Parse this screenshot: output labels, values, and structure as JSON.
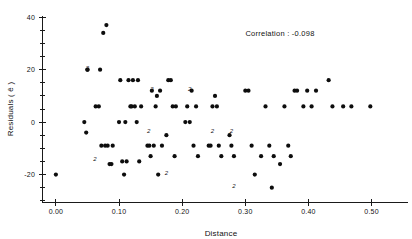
{
  "chart_data": {
    "type": "scatter",
    "title": "",
    "xlabel": "Distance",
    "ylabel": "Residuals ( ê )",
    "xlim": [
      -0.022,
      0.545
    ],
    "ylim": [
      -32,
      42
    ],
    "grid": false,
    "legend_position": "none",
    "annotations": [
      {
        "text": "Correlation : -0.098",
        "x": 0.355,
        "y": 33
      }
    ],
    "xticks": [
      0.0,
      0.1,
      0.2,
      0.3,
      0.4,
      0.5
    ],
    "xtick_labels": [
      "0.00",
      "0.10",
      "0.20",
      "0.30",
      "0.40",
      "0.50"
    ],
    "yticks": [
      -20,
      0,
      20,
      40
    ],
    "ytick_labels": [
      "-20",
      "0",
      "20",
      "40"
    ],
    "yticks_minor": [
      -30,
      -25,
      -15,
      -10,
      -5,
      5,
      10,
      15,
      25,
      30,
      35
    ],
    "point_marker": "filled-circle",
    "point_color": "#0d0d0d",
    "point_radius": 2.1,
    "overlap_marker_note": "Digit 2 denotes two coincident observations at that location",
    "x": [
      0.0,
      0.045,
      0.048,
      0.05,
      0.05,
      0.063,
      0.068,
      0.07,
      0.072,
      0.075,
      0.078,
      0.08,
      0.082,
      0.085,
      0.088,
      0.09,
      0.1,
      0.102,
      0.105,
      0.108,
      0.11,
      0.112,
      0.115,
      0.118,
      0.12,
      0.122,
      0.125,
      0.128,
      0.13,
      0.132,
      0.135,
      0.145,
      0.148,
      0.15,
      0.152,
      0.155,
      0.158,
      0.16,
      0.162,
      0.165,
      0.168,
      0.175,
      0.178,
      0.182,
      0.185,
      0.188,
      0.19,
      0.205,
      0.208,
      0.212,
      0.215,
      0.218,
      0.222,
      0.225,
      0.242,
      0.245,
      0.248,
      0.252,
      0.255,
      0.258,
      0.262,
      0.275,
      0.278,
      0.282,
      0.3,
      0.305,
      0.31,
      0.315,
      0.325,
      0.332,
      0.338,
      0.342,
      0.345,
      0.355,
      0.362,
      0.368,
      0.372,
      0.378,
      0.382,
      0.392,
      0.398,
      0.405,
      0.412,
      0.432,
      0.438,
      0.455,
      0.468,
      0.498
    ],
    "y": [
      -20,
      0,
      -4,
      20,
      20,
      6,
      6,
      20,
      -9,
      34,
      -9,
      37,
      -9,
      -16,
      -16,
      -9,
      0,
      16,
      -15,
      -20,
      0,
      -15,
      16,
      6,
      6,
      16,
      6,
      0,
      16,
      -15,
      6,
      -9,
      -9,
      -13,
      12,
      -9,
      6,
      10,
      -20,
      12,
      -9,
      -5,
      16,
      16,
      6,
      -13,
      6,
      0,
      6,
      0,
      12,
      -9,
      6,
      -13,
      -9,
      -9,
      6,
      10,
      6,
      -9,
      -13,
      -5,
      -9,
      -13,
      12,
      12,
      -9,
      -20,
      -13,
      6,
      -9,
      -25,
      -13,
      -16,
      6,
      -9,
      -13,
      12,
      12,
      6,
      12,
      6,
      12,
      16,
      6,
      6,
      6,
      6
    ],
    "overlap_pairs": [
      {
        "x": 0.05,
        "y": 20,
        "count": 2
      },
      {
        "x": 0.062,
        "y": -15,
        "count": 2
      },
      {
        "x": 0.147,
        "y": -4,
        "count": 2
      },
      {
        "x": 0.152,
        "y": 12,
        "count": 2
      },
      {
        "x": 0.175,
        "y": -20,
        "count": 2
      },
      {
        "x": 0.212,
        "y": 12,
        "count": 2
      },
      {
        "x": 0.248,
        "y": -4,
        "count": 2
      },
      {
        "x": 0.278,
        "y": -4,
        "count": 2
      },
      {
        "x": 0.282,
        "y": -25,
        "count": 2
      }
    ]
  }
}
